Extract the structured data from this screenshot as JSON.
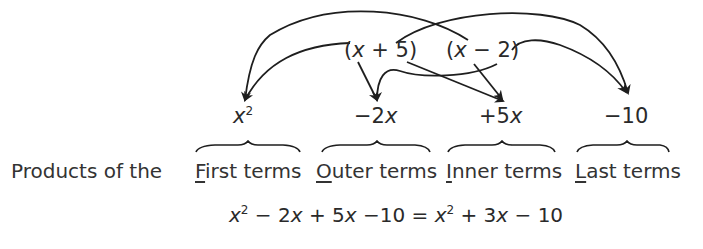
{
  "factors": [
    {
      "open": "(",
      "var": "x",
      "op": " + ",
      "num": "5",
      "close": ")"
    },
    {
      "open": "(",
      "var": "x",
      "op": " − ",
      "num": "2",
      "close": ")"
    }
  ],
  "products": [
    {
      "sign": "",
      "coef": "",
      "var": "x",
      "exp": "2"
    },
    {
      "sign": "−",
      "coef": "2",
      "var": "x",
      "exp": ""
    },
    {
      "sign": "+",
      "coef": "5",
      "var": "x",
      "exp": ""
    },
    {
      "sign": "−",
      "coef": "10",
      "var": "",
      "exp": ""
    }
  ],
  "row_label": "Products of the",
  "terms": [
    {
      "initial": "F",
      "rest": "irst terms"
    },
    {
      "initial": "O",
      "rest": "uter terms"
    },
    {
      "initial": "I",
      "rest": "nner terms"
    },
    {
      "initial": "L",
      "rest": "ast terms"
    }
  ],
  "equation": {
    "lhs_1_var": "x",
    "lhs_1_exp": "2",
    "lhs_2": " − 2",
    "lhs_2_var": "x",
    "lhs_3": " + 5",
    "lhs_3_var": "x",
    "lhs_4": " −10 = ",
    "rhs_1_var": "x",
    "rhs_1_exp": "2",
    "rhs_2": " + 3",
    "rhs_2_var": "x",
    "rhs_3": " − 10"
  },
  "colors": {
    "ink": "#2a2a2a",
    "background": "#ffffff"
  }
}
